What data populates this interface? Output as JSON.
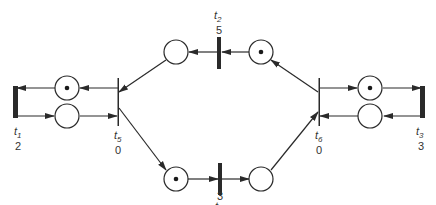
{
  "diagram": {
    "type": "petri-net",
    "colors": {
      "stroke": "#2a2a2a",
      "place_fill": "#ffffff",
      "token": "#1a1a1a"
    },
    "transitions": [
      {
        "id": "t1",
        "name": "t",
        "sub": "1",
        "value": "2"
      },
      {
        "id": "t2",
        "name": "t",
        "sub": "2",
        "value": "5"
      },
      {
        "id": "t3",
        "name": "t",
        "sub": "3",
        "value": "3"
      },
      {
        "id": "t4",
        "name": "t",
        "sub": "4",
        "value": "3"
      },
      {
        "id": "t5",
        "name": "t",
        "sub": "5",
        "value": "0"
      },
      {
        "id": "t6",
        "name": "t",
        "sub": "6",
        "value": "0"
      }
    ],
    "places": [
      {
        "id": "p-left-top",
        "tokens": 1
      },
      {
        "id": "p-left-bottom",
        "tokens": 0
      },
      {
        "id": "p-top-left",
        "tokens": 0
      },
      {
        "id": "p-top-right",
        "tokens": 1
      },
      {
        "id": "p-bottom-left",
        "tokens": 1
      },
      {
        "id": "p-bottom-right",
        "tokens": 0
      },
      {
        "id": "p-right-top",
        "tokens": 1
      },
      {
        "id": "p-right-bottom",
        "tokens": 0
      }
    ]
  }
}
